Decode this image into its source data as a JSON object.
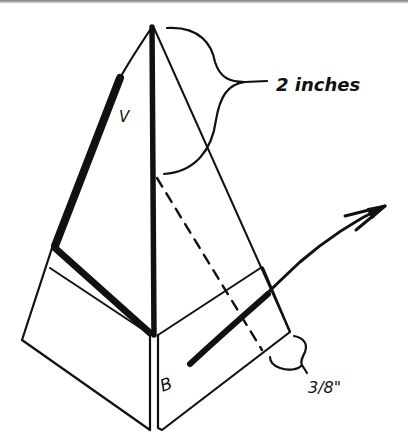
{
  "diagram": {
    "type": "origami folding instruction",
    "labels": {
      "dimension_top": "2 inches",
      "dimension_bottom": "3/8\"",
      "point_v": "V",
      "point_b": "B"
    },
    "colors": {
      "ink": "#111111",
      "paper": "#ffffff"
    }
  }
}
